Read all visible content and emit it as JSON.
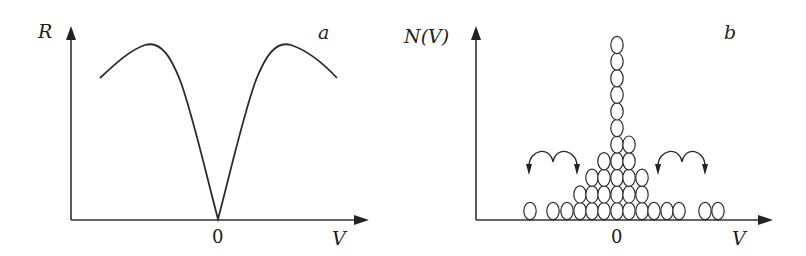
{
  "panels": {
    "a": {
      "panel_label": "a",
      "y_axis_label": "R",
      "x_axis_label": "V",
      "origin_tick_label": "0"
    },
    "b": {
      "panel_label": "b",
      "y_axis_label": "N(V)",
      "x_axis_label": "V",
      "origin_tick_label": "0"
    }
  },
  "chart_data": [
    {
      "type": "line",
      "title": "a",
      "xlabel": "V",
      "ylabel": "R",
      "description": "Symmetric curve with a sharp minimum at V=0 and two maxima on either side, decreasing toward the edges",
      "x_ticks": [
        "0"
      ],
      "grid": false,
      "points_px": [
        [
          100,
          78
        ],
        [
          120,
          60
        ],
        [
          145,
          45
        ],
        [
          165,
          55
        ],
        [
          185,
          100
        ],
        [
          205,
          175
        ],
        [
          218,
          220
        ],
        [
          231,
          175
        ],
        [
          251,
          100
        ],
        [
          271,
          55
        ],
        [
          291,
          45
        ],
        [
          316,
          58
        ],
        [
          337,
          78
        ]
      ]
    },
    {
      "type": "bar",
      "title": "b",
      "xlabel": "V",
      "ylabel": "N(V)",
      "description": "Histogram drawn as stacked ellipses (particles) concentrated at V=0; curved double-hop arrows on both sides indicate particles hopping toward V=0",
      "x_ticks": [
        "0"
      ],
      "grid": false,
      "column_centers_px": [
        530,
        553,
        567,
        580,
        592,
        604,
        617,
        629,
        642,
        654,
        667,
        679,
        705,
        718
      ],
      "column_counts": [
        1,
        1,
        1,
        2,
        3,
        4,
        11,
        5,
        3,
        1,
        1,
        1,
        1,
        1
      ]
    }
  ],
  "icons": {
    "left_hop_arrows": "double-arc-arrow-icon",
    "right_hop_arrows": "double-arc-arrow-icon"
  }
}
